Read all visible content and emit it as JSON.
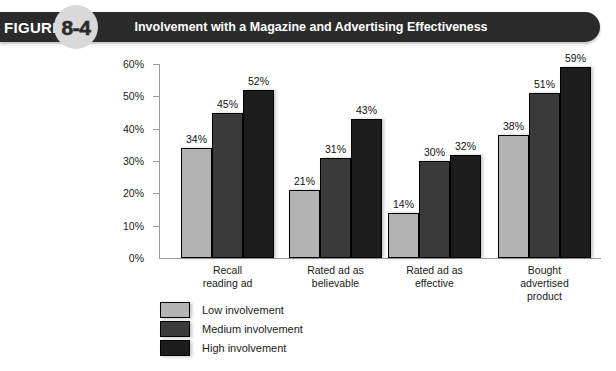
{
  "header": {
    "figure_word": "FIGURE",
    "figure_number": "8-4",
    "title": "Involvement with a Magazine and Advertising Effectiveness",
    "bar_color": "#2b2b2b",
    "badge_color": "#d9d9d9"
  },
  "chart_data": {
    "type": "bar",
    "title": "Involvement with a Magazine and Advertising Effectiveness",
    "xlabel": "",
    "ylabel": "",
    "ylim": [
      0,
      60
    ],
    "grid": false,
    "legend_position": "bottom-left",
    "ytick_labels": [
      "60%",
      "50%",
      "40%",
      "30%",
      "20%",
      "10%",
      "0%"
    ],
    "ytick_values": [
      60,
      50,
      40,
      30,
      20,
      10,
      0
    ],
    "categories": [
      "Recall reading ad",
      "Rated ad as believable",
      "Rated ad as effective",
      "Bought advertised product"
    ],
    "category_lines": [
      [
        "Recall",
        "reading ad"
      ],
      [
        "Rated ad as",
        "believable"
      ],
      [
        "Rated ad as",
        "effective"
      ],
      [
        "Bought",
        "advertised",
        "product"
      ]
    ],
    "series": [
      {
        "name": "Low involvement",
        "color": "#b3b3b3",
        "values": [
          34,
          21,
          14,
          38
        ],
        "labels": [
          "34%",
          "21%",
          "14%",
          "38%"
        ]
      },
      {
        "name": "Medium involvement",
        "color": "#3a3a3a",
        "values": [
          45,
          31,
          30,
          51
        ],
        "labels": [
          "45%",
          "31%",
          "30%",
          "51%"
        ]
      },
      {
        "name": "High involvement",
        "color": "#1c1c1c",
        "values": [
          52,
          43,
          32,
          59
        ],
        "labels": [
          "52%",
          "43%",
          "32%",
          "59%"
        ]
      }
    ]
  }
}
